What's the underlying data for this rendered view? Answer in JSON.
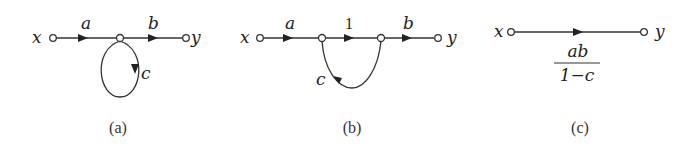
{
  "diagrams": [
    {
      "id": "a",
      "caption": "(a)",
      "input_label": "x",
      "output_label": "y",
      "edges": [
        {
          "from": "x",
          "to": "n1",
          "gain": "a"
        },
        {
          "from": "n1",
          "to": "y",
          "gain": "b"
        },
        {
          "from": "n1",
          "to": "n1",
          "gain": "c",
          "type": "self-loop"
        }
      ]
    },
    {
      "id": "b",
      "caption": "(b)",
      "input_label": "x",
      "output_label": "y",
      "edges": [
        {
          "from": "x",
          "to": "n1",
          "gain": "a"
        },
        {
          "from": "n1",
          "to": "n2",
          "gain": "1"
        },
        {
          "from": "n2",
          "to": "y",
          "gain": "b"
        },
        {
          "from": "n2",
          "to": "n1",
          "gain": "c",
          "type": "feedback"
        }
      ]
    },
    {
      "id": "c",
      "caption": "(c)",
      "input_label": "x",
      "output_label": "y",
      "edges": [
        {
          "from": "x",
          "to": "y",
          "gain_numerator": "ab",
          "gain_denominator": "1−c"
        }
      ]
    }
  ]
}
